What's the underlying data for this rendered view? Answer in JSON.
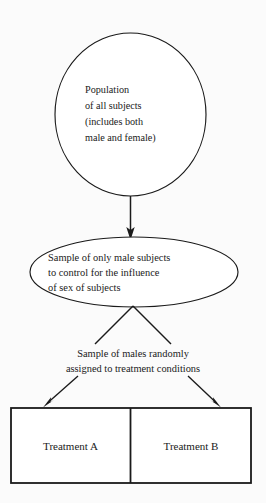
{
  "diagram": {
    "colors": {
      "background": "#fbfbfb",
      "stroke": "#1a1a1a",
      "shape_fill": "#ffffff"
    },
    "population_node": {
      "shape": "circle",
      "lines": [
        "Population",
        "of all subjects",
        "(includes both",
        "male and female)"
      ]
    },
    "sample_node": {
      "shape": "ellipse",
      "lines": [
        "Sample of only male subjects",
        "to control for the influence",
        "of sex of subjects"
      ]
    },
    "assignment_label": {
      "lines": [
        "Sample of males randomly",
        "assigned to treatment conditions"
      ]
    },
    "treatment_boxes": [
      {
        "label": "Treatment A"
      },
      {
        "label": "Treatment B"
      }
    ]
  }
}
